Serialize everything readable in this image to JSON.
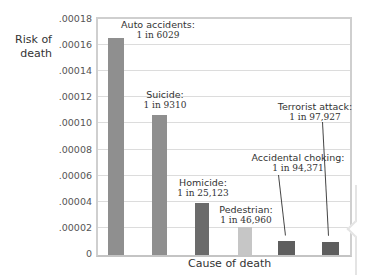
{
  "chart_data": {
    "type": "bar",
    "title": "",
    "xlabel": "Cause of death",
    "ylabel": "Risk of death",
    "ylim": [
      0,
      0.00018
    ],
    "yticks": [
      ".00018",
      ".00016",
      ".00014",
      ".00012",
      ".00010",
      ".00008",
      ".00006",
      ".00004",
      ".00002",
      "0"
    ],
    "grid": true,
    "legend": null,
    "categories": [
      "Auto accidents",
      "Suicide",
      "Homicide",
      "Pedestrian",
      "Accidental choking",
      "Terrorist attack"
    ],
    "values": [
      0.000166,
      0.000107,
      3.98e-05,
      2.13e-05,
      1.06e-05,
      1.02e-05
    ],
    "annotations": [
      {
        "name": "Auto accidents:",
        "odds": "1 in 6029"
      },
      {
        "name": "Suicide:",
        "odds": "1 in 9310"
      },
      {
        "name": "Homicide:",
        "odds": "1 in 25,123"
      },
      {
        "name": "Pedestrian:",
        "odds": "1 in 46,960"
      },
      {
        "name": "Accidental choking:",
        "odds": "1 in 94,371"
      },
      {
        "name": "Terrorist attack:",
        "odds": "1 in 97,927"
      }
    ],
    "colors": [
      "#8f8f8f",
      "#8f8f8f",
      "#6b6b6b",
      "#c6c6c6",
      "#5e5e5e",
      "#5e5e5e"
    ]
  },
  "axis": {
    "ylabel_line1": "Risk of",
    "ylabel_line2": "death",
    "xlabel": "Cause of death"
  }
}
